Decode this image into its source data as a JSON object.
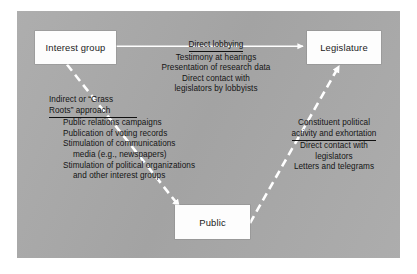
{
  "figure": {
    "background_color": "#a9a9a9",
    "node_fill_color": "#fdfdfd",
    "arrow_color": "#ffffff",
    "text_color": "#141414"
  },
  "nodes": {
    "interest_group": {
      "label": "Interest group"
    },
    "legislature": {
      "label": "Legislature"
    },
    "public": {
      "label": "Public"
    }
  },
  "arrows": {
    "interest_to_legislature": {
      "style": "solid",
      "label": "Direct lobbying"
    },
    "interest_to_public": {
      "style": "dashed",
      "label": "Indirect or “Grass Roots” approach"
    },
    "public_to_legislature": {
      "style": "dashed",
      "label": "Constituent political activity and exhortation"
    }
  },
  "text_blocks": {
    "direct_lobbying": {
      "heading": "Direct lobbying",
      "lines": [
        "Testimony at hearings",
        "Presentation of research data",
        "Direct contact with",
        "legislators by lobbyists"
      ]
    },
    "grass_roots": {
      "heading_line1": "Indirect or “Grass",
      "heading_line2": "Roots” approach",
      "lines": [
        "Public relations campaigns",
        "Publication of voting records",
        "Stimulation of communications",
        "media (e.g., newspapers)",
        "Stimulation of political organizations",
        "and other interest groups"
      ]
    },
    "constituent": {
      "heading_line1": "Constituent political",
      "heading_line2": "activity and exhortation",
      "lines": [
        "Direct contact with",
        "legislators",
        "Letters and telegrams"
      ]
    }
  }
}
